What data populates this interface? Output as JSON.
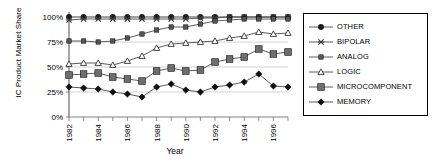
{
  "chart_data": {
    "type": "line",
    "title": "",
    "xlabel": "Year",
    "ylabel": "IC Product Market Share",
    "x": [
      1982,
      1983,
      1984,
      1985,
      1986,
      1987,
      1988,
      1989,
      1990,
      1991,
      1992,
      1993,
      1994,
      1995,
      1996,
      1997
    ],
    "xtick_labels": [
      "1982",
      "1984",
      "1986",
      "1988",
      "1990",
      "1992",
      "1994",
      "1996"
    ],
    "xtick_values": [
      1982,
      1984,
      1986,
      1988,
      1990,
      1992,
      1994,
      1996
    ],
    "xlim": [
      1982,
      1997
    ],
    "ylim": [
      0,
      100
    ],
    "ytick_labels": [
      "0%",
      "25%",
      "50%",
      "75%",
      "100%"
    ],
    "ytick_values": [
      0,
      25,
      50,
      75,
      100
    ],
    "grid": "horizontal",
    "legend_position": "right-outside",
    "series": [
      {
        "name": "OTHER",
        "marker": "filled-circle",
        "color": "#1a1a1a",
        "values": [
          100,
          100,
          100,
          100,
          100,
          100,
          100,
          100,
          100,
          100,
          100,
          100,
          100,
          100,
          100,
          100
        ]
      },
      {
        "name": "BIPOLAR",
        "marker": "x-cross",
        "color": "#3c3c3c",
        "values": [
          97,
          98,
          98,
          98,
          98,
          98,
          98,
          98,
          98,
          99,
          99,
          100,
          100,
          100,
          100,
          100
        ]
      },
      {
        "name": "ANALOG",
        "marker": "small-filled-square",
        "color": "#555555",
        "values": [
          76,
          76,
          75,
          76,
          79,
          83,
          87,
          90,
          90,
          93,
          96,
          97,
          98,
          98,
          98,
          98
        ]
      },
      {
        "name": "LOGIC",
        "marker": "open-triangle",
        "color": "#333333",
        "values": [
          53,
          54,
          54,
          52,
          56,
          61,
          69,
          73,
          74,
          75,
          76,
          79,
          81,
          85,
          83,
          84
        ]
      },
      {
        "name": "MICROCOMPONENT",
        "marker": "large-filled-square",
        "color": "#6e6e6e",
        "values": [
          42,
          43,
          44,
          40,
          38,
          36,
          46,
          49,
          46,
          47,
          55,
          58,
          60,
          68,
          63,
          65
        ]
      },
      {
        "name": "MEMORY",
        "marker": "filled-diamond",
        "color": "#111111",
        "values": [
          30,
          29,
          28,
          25,
          23,
          20,
          30,
          33,
          27,
          25,
          30,
          32,
          35,
          43,
          31,
          30
        ]
      }
    ]
  },
  "legend": {
    "items": [
      {
        "label": "OTHER",
        "marker": "filled-circle"
      },
      {
        "label": "BIPOLAR",
        "marker": "x-cross"
      },
      {
        "label": "ANALOG",
        "marker": "small-filled-square"
      },
      {
        "label": "LOGIC",
        "marker": "open-triangle"
      },
      {
        "label": "MICROCOMPONENT",
        "marker": "large-filled-square"
      },
      {
        "label": "MEMORY",
        "marker": "filled-diamond"
      }
    ]
  },
  "colors": {
    "axis": "#808080",
    "grid": "#c8c8c8",
    "line": "#4a4a4a",
    "text": "#000000",
    "background": "#ffffff"
  }
}
